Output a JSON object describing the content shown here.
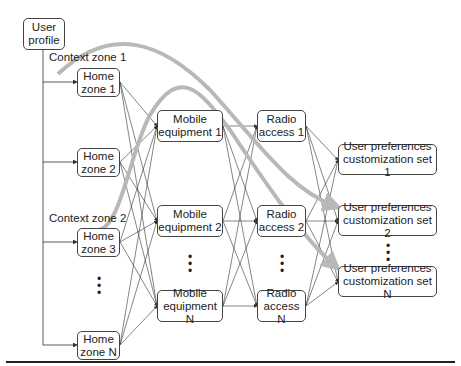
{
  "diagram": {
    "user_profile": "User\nprofile",
    "context_labels": [
      "Context zone 1",
      "Context zone 2"
    ],
    "home_zones": [
      "Home\nzone 1",
      "Home\nzone 2",
      "Home\nzone 3",
      "Home\nzone N"
    ],
    "mobile_equipment": [
      "Mobile\nequipment 1",
      "Mobile\nequipment 2",
      "Mobile\nequipment N"
    ],
    "radio_access": [
      "Radio\naccess 1",
      "Radio\naccess 2",
      "Radio\naccess N"
    ],
    "user_preferences": [
      "User preferences\ncustomization set 1",
      "User preferences\ncustomization set 2",
      "User preferences\ncustomization set N"
    ],
    "ellipsis": "•\n•\n•",
    "colors": {
      "line": "#333333",
      "context_path": "#b8b8b8",
      "box_border": "#444444"
    }
  }
}
